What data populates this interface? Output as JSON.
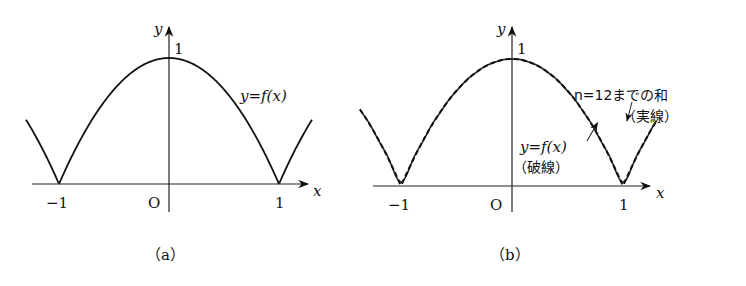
{
  "panels": [
    {
      "id": "a",
      "caption": "（a）",
      "x_axis_label": "x",
      "y_axis_label": "y",
      "origin_label": "O",
      "x_ticks": [
        {
          "value": -1,
          "label": "−1"
        },
        {
          "value": 1,
          "label": "1"
        }
      ],
      "y_ticks": [
        {
          "value": 1,
          "label": "1"
        }
      ],
      "curve_label": "y=f(x)",
      "curves": [
        {
          "name": "f(x)",
          "style": "solid"
        }
      ]
    },
    {
      "id": "b",
      "caption": "（b）",
      "x_axis_label": "x",
      "y_axis_label": "y",
      "origin_label": "O",
      "x_ticks": [
        {
          "value": -1,
          "label": "−1"
        },
        {
          "value": 1,
          "label": "1"
        }
      ],
      "y_ticks": [
        {
          "value": 1,
          "label": "1"
        }
      ],
      "sum_label_line1": "n=12までの和",
      "sum_label_line2": "（実線）",
      "f_label_line1": "y=f(x)",
      "f_label_line2": "（破線）",
      "curves": [
        {
          "name": "n=12 partial sum",
          "style": "solid"
        },
        {
          "name": "f(x)",
          "style": "dashed"
        }
      ]
    }
  ],
  "chart_data": [
    {
      "type": "line",
      "title": "(a)",
      "xlabel": "x",
      "ylabel": "y",
      "xlim": [
        -1.35,
        1.35
      ],
      "ylim": [
        0,
        1
      ],
      "function": "f(x) = 1 - x^2 on [-1,1], periodic with period 2",
      "series": [
        {
          "name": "y=f(x)",
          "style": "solid",
          "x": [
            -1.3,
            -1,
            -0.5,
            0,
            0.5,
            1,
            1.3
          ],
          "y": [
            0.51,
            0,
            0.75,
            1,
            0.75,
            0,
            0.51
          ]
        }
      ]
    },
    {
      "type": "line",
      "title": "(b)",
      "xlabel": "x",
      "ylabel": "y",
      "xlim": [
        -1.35,
        1.35
      ],
      "ylim": [
        0,
        1
      ],
      "series": [
        {
          "name": "n=12までの和 (実線)",
          "style": "solid",
          "x": [
            -1.3,
            -1,
            -0.5,
            0,
            0.5,
            1,
            1.3
          ],
          "y": [
            0.51,
            0.01,
            0.75,
            1,
            0.75,
            0.01,
            0.51
          ]
        },
        {
          "name": "y=f(x) (破線)",
          "style": "dashed",
          "x": [
            -1.3,
            -1,
            -0.5,
            0,
            0.5,
            1,
            1.3
          ],
          "y": [
            0.51,
            0,
            0.75,
            1,
            0.75,
            0,
            0.51
          ]
        }
      ]
    }
  ]
}
